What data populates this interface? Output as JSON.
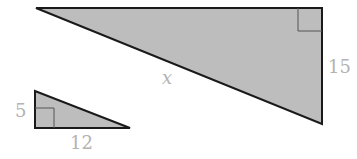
{
  "diagram": {
    "large_triangle": {
      "hypotenuse_label": "x",
      "leg_label": "15",
      "fill": "#bdbdbd",
      "stroke": "#1a1a1a"
    },
    "small_triangle": {
      "vertical_leg_label": "5",
      "horizontal_leg_label": "12",
      "fill": "#bdbdbd",
      "stroke": "#1a1a1a"
    },
    "label_color": "#b3b3b3"
  }
}
